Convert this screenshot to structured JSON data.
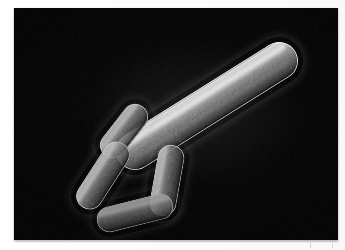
{
  "document": {
    "type": "scanning-electron-micrograph",
    "subject": "rod-shaped bacteria (bacilli) cluster",
    "background_color": "#000000",
    "page_color": "#ffffff",
    "plate": {
      "x": 14,
      "y": 8,
      "width": 324,
      "height": 232
    }
  },
  "specimens": [
    {
      "id": "large-bacillus",
      "label": "large elongated bacillus",
      "length": 208,
      "width": 38,
      "center_x": 207,
      "center_y": 106,
      "rotation_deg": -32,
      "brightness": "bright",
      "has_seam": true
    },
    {
      "id": "rod-upper-left",
      "label": "small rod upper left",
      "length": 62,
      "width": 26,
      "center_x": 124,
      "center_y": 131,
      "rotation_deg": -52,
      "brightness": "medium",
      "has_seam": false
    },
    {
      "id": "rod-left",
      "label": "small rod left",
      "length": 76,
      "width": 27,
      "center_x": 103,
      "center_y": 175,
      "rotation_deg": -57,
      "brightness": "medium",
      "has_seam": false
    },
    {
      "id": "rod-right",
      "label": "small rod right vertical",
      "length": 72,
      "width": 27,
      "center_x": 167,
      "center_y": 180,
      "rotation_deg": -80,
      "brightness": "medium",
      "has_seam": false
    },
    {
      "id": "rod-bottom",
      "label": "small rod bottom horizontal",
      "length": 78,
      "width": 26,
      "center_x": 135,
      "center_y": 213,
      "rotation_deg": -14,
      "brightness": "dim",
      "has_seam": false
    }
  ],
  "margin_marks": [
    {
      "id": "tick-left",
      "x": 310,
      "y": 243
    },
    {
      "id": "tick-right",
      "x": 332,
      "y": 243
    }
  ],
  "colors": {
    "field": "#000000",
    "cell_highlight": "#f2f2f2",
    "cell_midtone": "#a8a8a8",
    "cell_shadow": "#1a1a1a",
    "page": "#ffffff",
    "tick": "#d6d6d6"
  }
}
